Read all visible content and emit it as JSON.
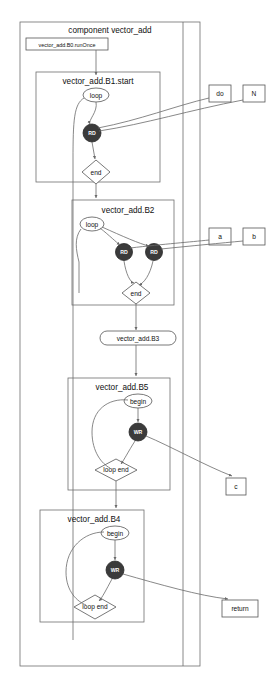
{
  "diagram": {
    "title": "component vector_add",
    "root_cluster": {
      "label": "component vector_add",
      "name": "component-vector-add"
    },
    "entry_node": {
      "label": "vector_add.B0.runOnce",
      "shape": "box"
    },
    "clusters": [
      {
        "id": "b1",
        "label": "vector_add.B1.start",
        "nodes": [
          {
            "id": "b1-loop",
            "label": "loop",
            "shape": "ellipse"
          },
          {
            "id": "b1-rd",
            "label": "RD",
            "shape": "circle-filled"
          },
          {
            "id": "b1-end",
            "label": "end",
            "shape": "diamond"
          }
        ]
      },
      {
        "id": "b2",
        "label": "vector_add.B2",
        "nodes": [
          {
            "id": "b2-loop",
            "label": "loop",
            "shape": "ellipse"
          },
          {
            "id": "b2-rd1",
            "label": "RD",
            "shape": "circle-filled"
          },
          {
            "id": "b2-rd2",
            "label": "RD",
            "shape": "circle-filled"
          },
          {
            "id": "b2-end",
            "label": "end",
            "shape": "diamond"
          }
        ]
      },
      {
        "id": "b5",
        "label": "vector_add.B5",
        "nodes": [
          {
            "id": "b5-begin",
            "label": "begin",
            "shape": "ellipse"
          },
          {
            "id": "b5-wr",
            "label": "WR",
            "shape": "circle-filled"
          },
          {
            "id": "b5-loopend",
            "label": "loop end",
            "shape": "diamond"
          }
        ]
      },
      {
        "id": "b4",
        "label": "vector_add.B4",
        "nodes": [
          {
            "id": "b4-begin",
            "label": "begin",
            "shape": "ellipse"
          },
          {
            "id": "b4-wr",
            "label": "WR",
            "shape": "circle-filled"
          },
          {
            "id": "b4-loopend",
            "label": "loop end",
            "shape": "diamond"
          }
        ]
      }
    ],
    "mid_node": {
      "id": "b3",
      "label": "vector_add.B3",
      "shape": "rounded-box"
    },
    "ports": [
      {
        "id": "port-do",
        "label": "do"
      },
      {
        "id": "port-n",
        "label": "N"
      },
      {
        "id": "port-a",
        "label": "a"
      },
      {
        "id": "port-b",
        "label": "b"
      },
      {
        "id": "port-c",
        "label": "c"
      },
      {
        "id": "port-return",
        "label": "return"
      }
    ],
    "colors": {
      "background": "#ffffff",
      "stroke": "#6a6a6a",
      "node_fill": "#ffffff",
      "dark_node_fill": "#3b3b3b",
      "text": "#101010"
    }
  }
}
